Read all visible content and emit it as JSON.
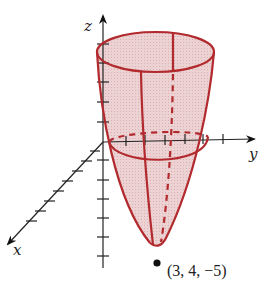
{
  "figure": {
    "axes": {
      "x_label": "x",
      "y_label": "y",
      "z_label": "z"
    },
    "surface": {
      "type": "paraboloid",
      "fill_color": "#e8c9cb",
      "edge_color": "#b22a2e"
    },
    "point": {
      "label": "(3, 4, −5)",
      "color": "#111111"
    },
    "axis_color": "#222222"
  }
}
